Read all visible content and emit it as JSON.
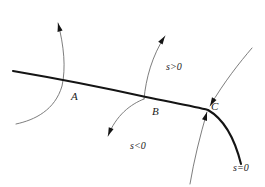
{
  "figure": {
    "type": "phase-portrait-diagram",
    "background_color": "#ffffff",
    "main_curve_color": "#141414",
    "flow_curve_color": "#6e6e6e",
    "label_color": "#1a1a1a",
    "point_labels": [
      {
        "id": "A",
        "text": "A",
        "x": 71,
        "y": 91
      },
      {
        "id": "B",
        "text": "B",
        "x": 152,
        "y": 106
      },
      {
        "id": "C",
        "text": "C",
        "x": 211,
        "y": 101
      }
    ],
    "region_labels": [
      {
        "id": "s-positive",
        "text": "s>0",
        "x": 166,
        "y": 62
      },
      {
        "id": "s-negative",
        "text": "s<0",
        "x": 130,
        "y": 141
      },
      {
        "id": "s-zero",
        "text": "s=0",
        "x": 233,
        "y": 163
      }
    ],
    "marked_points": [
      {
        "id": "A",
        "x": 64,
        "y": 82
      },
      {
        "id": "B",
        "x": 146,
        "y": 97
      },
      {
        "id": "C",
        "x": 208,
        "y": 110
      }
    ],
    "main_curve": {
      "name": "switching-surface-trajectory",
      "path": "M 13,71 C 60,79 110,89 146,97 C 175,103 196,107 208,110 C 222,118 234,136 241,164",
      "stroke_width": 2.1
    },
    "flow_curves": [
      {
        "id": "flow-through-A",
        "direction": "upward",
        "path": "M 16,124 C 35,120 55,110 62,86 C 66,68 64,46 58,23",
        "arrow_at": "top",
        "arrow_x": 58,
        "arrow_y": 23,
        "arrow_angle": -104
      },
      {
        "id": "flow-through-B",
        "direction": "upward",
        "path": "M 144,99 C 146,78 152,56 165,36",
        "arrow_at": "top",
        "arrow_x": 165,
        "arrow_y": 36,
        "arrow_angle": -57
      },
      {
        "id": "flow-below-B",
        "direction": "downward",
        "path": "M 144,99 C 131,104 116,115 108,136",
        "arrow_at": "bottom",
        "arrow_x": 108,
        "arrow_y": 136,
        "arrow_angle": 112
      },
      {
        "id": "flow-into-C-from-upper-right",
        "direction": "toward-C",
        "path": "M 252,48 C 240,62 224,82 210,106",
        "arrow_at": "end",
        "arrow_x": 210,
        "arrow_y": 106,
        "arrow_angle": 120
      },
      {
        "id": "flow-into-C-from-below",
        "direction": "toward-C",
        "path": "M 190,184 C 194,160 200,136 207,112",
        "arrow_at": "end",
        "arrow_x": 207,
        "arrow_y": 112,
        "arrow_angle": -73
      }
    ]
  }
}
